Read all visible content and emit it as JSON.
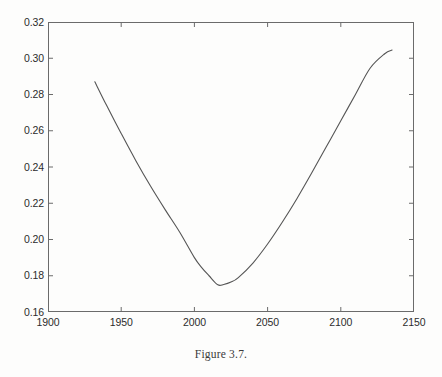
{
  "figure": {
    "caption": "Figure 3.7."
  },
  "chart_data": {
    "type": "line",
    "title": "",
    "subtitle": "",
    "xlabel": "",
    "ylabel": "",
    "xlim": [
      1900,
      2150
    ],
    "ylim": [
      0.16,
      0.32
    ],
    "xticks": [
      1900,
      1950,
      2000,
      2050,
      2100,
      2150
    ],
    "yticks": [
      0.16,
      0.18,
      0.2,
      0.22,
      0.24,
      0.26,
      0.28,
      0.3,
      0.32
    ],
    "xtick_labels": [
      "1900",
      "1950",
      "2000",
      "2050",
      "2100",
      "2150"
    ],
    "ytick_labels": [
      "0.16",
      "0.18",
      "0.20",
      "0.22",
      "0.24",
      "0.26",
      "0.28",
      "0.30",
      "0.32"
    ],
    "grid": false,
    "legend": null,
    "legend_position": "none",
    "box": true,
    "tick_direction": "in",
    "line_color": "#555555",
    "axis_color": "#6b6b6b",
    "background_color": "#fdfdfc",
    "series": [
      {
        "name": "curve",
        "x": [
          1932,
          1940,
          1950,
          1960,
          1970,
          1980,
          1990,
          2000,
          2005,
          2010,
          2016,
          2020,
          2025,
          2030,
          2040,
          2050,
          2060,
          2070,
          2080,
          2090,
          2100,
          2110,
          2120,
          2130,
          2135
        ],
        "y": [
          0.287,
          0.274,
          0.2585,
          0.2435,
          0.2295,
          0.2165,
          0.204,
          0.19,
          0.1845,
          0.18,
          0.175,
          0.1752,
          0.1765,
          0.179,
          0.187,
          0.1975,
          0.2095,
          0.2225,
          0.2365,
          0.251,
          0.2655,
          0.28,
          0.2945,
          0.3025,
          0.3045
        ]
      }
    ],
    "annotations": [],
    "minimum": {
      "x": 2016,
      "y": 0.175
    }
  }
}
